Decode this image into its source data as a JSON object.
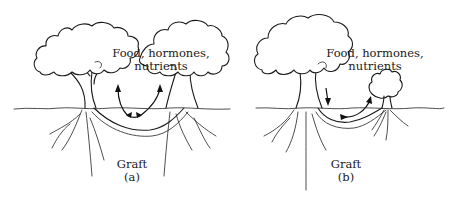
{
  "figure": {
    "panels": [
      {
        "id": "a",
        "flow_label_line1": "Food, hormones,",
        "flow_label_line2": "nutrients",
        "graft_label": "Graft",
        "panel_letter": "(a)",
        "description": "Two mature trees with root grafts exchanging substances in both directions"
      },
      {
        "id": "b",
        "flow_label_line1": "Food, hormones,",
        "flow_label_line2": "nutrients",
        "graft_label": "Graft",
        "panel_letter": "(b)",
        "description": "Large tree transferring substances through root graft to small tree"
      }
    ],
    "colors": {
      "ink": "#1a1a1a",
      "background": "#ffffff"
    }
  }
}
